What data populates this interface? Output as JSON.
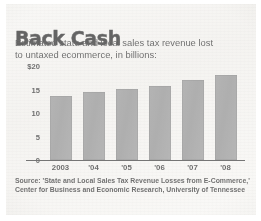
{
  "headline": "Back Cash",
  "subtitle_lines": [
    "Estimated state and local sales tax revenue lost",
    "to untaxed ecommerce, in billions:"
  ],
  "source_lines": [
    "Source: 'State and Local Sales Tax Revenue Losses from E-Commerce,'",
    "Center for Business and Economic Research, University of Tennessee"
  ],
  "colors": {
    "bar": "#858585",
    "axis": "#2b2b2b",
    "text": "#1b1b1b",
    "paper": "#f0eeea"
  },
  "chart_data": {
    "type": "bar",
    "title": "Back Cash",
    "subtitle": "Estimated state and local sales tax revenue lost to untaxed ecommerce, in billions:",
    "categories": [
      "2003",
      "'04",
      "'05",
      "'06",
      "'07",
      "'08"
    ],
    "values": [
      13.7,
      14.4,
      15.1,
      15.7,
      17.1,
      18.0
    ],
    "xlabel": "",
    "ylabel": "",
    "ylim": [
      0,
      20
    ],
    "yticks": [
      0,
      5,
      10,
      15,
      20
    ],
    "ytick_labels": [
      "0",
      "5",
      "10",
      "15",
      "$20"
    ],
    "grid": false,
    "legend": "none",
    "units": "billions of U.S. dollars",
    "source": "Source: 'State and Local Sales Tax Revenue Losses from E-Commerce,' Center for Business and Economic Research, University of Tennessee"
  }
}
